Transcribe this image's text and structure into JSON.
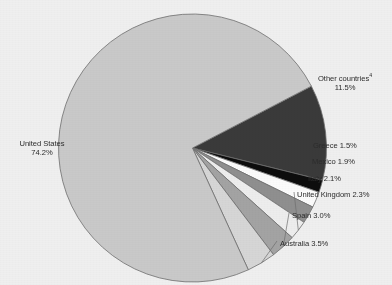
{
  "chart_data": {
    "type": "pie",
    "title": "",
    "xlabel": "",
    "ylabel": "",
    "legend_position": "callout-labels",
    "grid": false,
    "categories": [
      "United States",
      "Other countries",
      "Greece",
      "Mexico",
      "Italy",
      "United Kingdom",
      "Spain",
      "Australia"
    ],
    "values": [
      74.2,
      11.5,
      1.5,
      1.9,
      2.1,
      2.3,
      3.0,
      3.5
    ],
    "unit": "%",
    "slices": [
      {
        "label": "United States",
        "value": 74.2,
        "value_text": "74.2%",
        "color": "#c9c9c9",
        "footnote": ""
      },
      {
        "label": "Other countries",
        "value": 11.5,
        "value_text": "11.5%",
        "color": "#3a3a3a",
        "footnote": "4"
      },
      {
        "label": "Greece",
        "value": 1.5,
        "value_text": "1.5%",
        "color": "#0d0d0d",
        "footnote": ""
      },
      {
        "label": "Mexico",
        "value": 1.9,
        "value_text": "1.9%",
        "color": "#fbfbfb",
        "footnote": ""
      },
      {
        "label": "Italy",
        "value": 2.1,
        "value_text": "2.1%",
        "color": "#8f8f8f",
        "footnote": ""
      },
      {
        "label": "United Kingdom",
        "value": 2.3,
        "value_text": "2.3%",
        "color": "#ededed",
        "footnote": ""
      },
      {
        "label": "Spain",
        "value": 3.0,
        "value_text": "3.0%",
        "color": "#a3a3a3",
        "footnote": ""
      },
      {
        "label": "Australia",
        "value": 3.5,
        "value_text": "3.5%",
        "color": "#d6d6d6",
        "footnote": ""
      }
    ]
  },
  "labels": {
    "united_states_name": "United States",
    "united_states_value": "74.2%",
    "other_countries_name": "Other countries",
    "other_countries_sup": "4",
    "other_countries_value": "11.5%",
    "greece": "Greece 1.5%",
    "mexico": "Mexico 1.9%",
    "italy": "Italy 2.1%",
    "united_kingdom": "United Kingdom 2.3%",
    "spain": "Spain 3.0%",
    "australia": "Australia 3.5%"
  },
  "style": {
    "background": "#efefef",
    "outline": "#6e6e6e",
    "text": "#2c2c2c"
  }
}
